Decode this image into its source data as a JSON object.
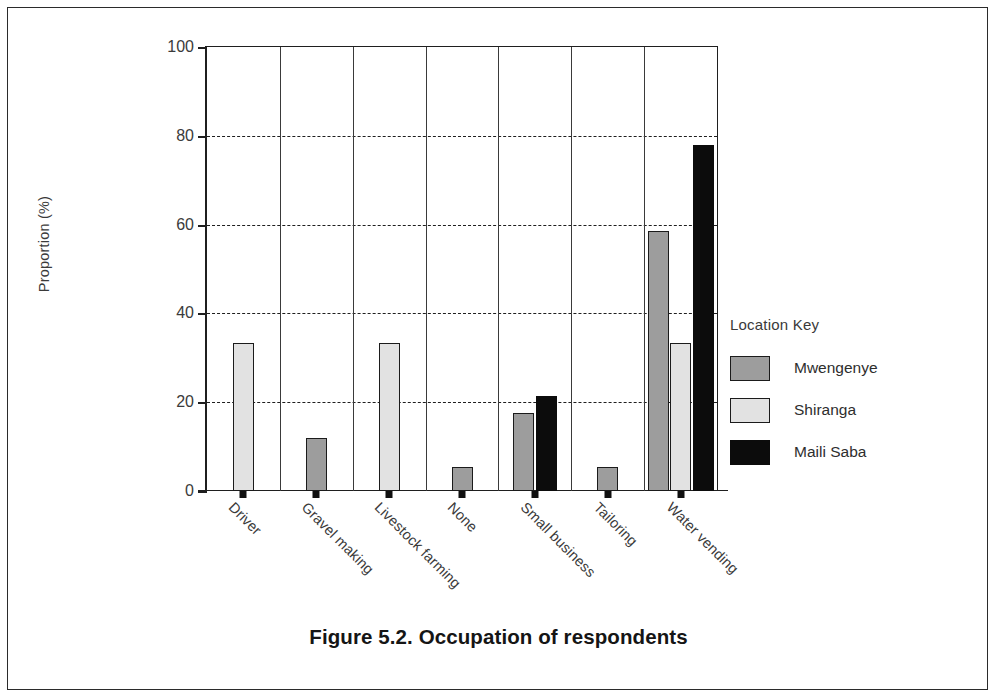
{
  "caption": "Figure 5.2. Occupation of respondents",
  "legend": {
    "title": "Location Key",
    "entries": [
      {
        "label": "Mwengenye",
        "color": "#9d9d9d"
      },
      {
        "label": "Shiranga",
        "color": "#e2e2e2"
      },
      {
        "label": "Maili Saba",
        "color": "#0c0c0c"
      }
    ]
  },
  "chart_data": {
    "type": "bar",
    "title": "Figure 5.2. Occupation of respondents",
    "xlabel": "",
    "ylabel": "Proportion (%)",
    "ylim": [
      0,
      100
    ],
    "yticks": [
      0,
      20,
      40,
      60,
      80,
      100
    ],
    "ytick_labels": [
      "0",
      "20",
      "40",
      "60",
      "80",
      "100"
    ],
    "grid": "horizontal-dashed",
    "legend_position": "right",
    "legend_title": "Location Key",
    "categories": [
      "Driver",
      "Gravel making",
      "Livestock farming",
      "None",
      "Small business",
      "Tailoring",
      "Water vending"
    ],
    "series": [
      {
        "name": "Mwengenye",
        "color": "#9d9d9d",
        "values": [
          0,
          12.0,
          0,
          5.5,
          17.5,
          5.5,
          58.5
        ]
      },
      {
        "name": "Shiranga",
        "color": "#e2e2e2",
        "values": [
          33.3,
          0,
          33.3,
          0,
          0,
          0,
          33.3
        ]
      },
      {
        "name": "Maili Saba",
        "color": "#0c0c0c",
        "values": [
          0,
          0,
          0,
          0,
          21.5,
          0,
          78.0
        ]
      }
    ]
  }
}
